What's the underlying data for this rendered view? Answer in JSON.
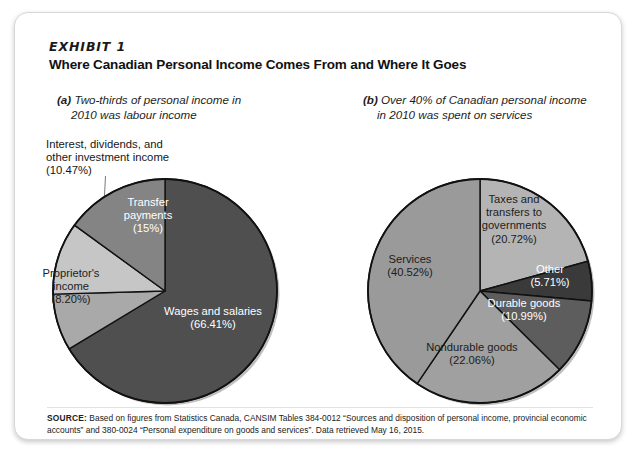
{
  "exhibit": {
    "label": "EXHIBIT 1",
    "title": "Where Canadian Personal Income Comes From and Where It Goes"
  },
  "panels": {
    "a": {
      "tag": "(a)",
      "caption_line1": "Two-thirds of personal income in",
      "caption_line2": "2010 was labour income",
      "callout": "Interest, dividends, and\nother investment income\n(10.47%)"
    },
    "b": {
      "tag": "(b)",
      "caption_line1": "Over 40% of Canadian personal income",
      "caption_line2": "in 2010 was spent on services"
    }
  },
  "source": {
    "label": "SOURCE:",
    "text": " Based on figures from Statistics Canada, CANSIM Tables 384-0012 “Sources and disposition of personal income, provincial economic accounts” and 380-0024 “Personal expenditure on goods and services”. Data retrieved May 16, 2015."
  },
  "colors": {
    "darkest": "#3a3a3a",
    "dark": "#4f4f4f",
    "mid_dark": "#6b6b6b",
    "mid": "#848484",
    "light": "#a9a9a9",
    "lightest": "#c6c6c6",
    "outline": "#111111",
    "text_on_dark": "#ffffff",
    "text_on_light": "#1c1c1c"
  },
  "chart_data": [
    {
      "type": "pie",
      "id": "sources-of-personal-income",
      "title": "Two-thirds of personal income in 2010 was labour income",
      "start_angle_deg": 0,
      "direction": "clockwise",
      "labels": [
        "Wages and salaries",
        "Proprietor's income",
        "Interest, dividends, and other investment income",
        "Transfer payments"
      ],
      "values": [
        66.41,
        8.2,
        10.47,
        15.0
      ],
      "value_labels": [
        "(66.41%)",
        "(8.20%)",
        "(10.47%)",
        "(15%)"
      ],
      "display_labels": [
        "Wages and salaries\n(66.41%)",
        "Proprietor's\nincome\n(8.20%)",
        "Interest, dividends, and\nother investment income\n(10.47%)",
        "Transfer\npayments\n(15%)"
      ],
      "slice_colors": [
        "#4f4f4f",
        "#a9a9a9",
        "#c6c6c6",
        "#848484"
      ],
      "label_text_colors": [
        "#ffffff",
        "#1c1c1c",
        "#1c1c1c",
        "#ffffff"
      ],
      "units": "percent"
    },
    {
      "type": "pie",
      "id": "disposition-of-personal-expenditure",
      "title": "Over 40% of Canadian personal income in 2010 was spent on services",
      "start_angle_deg": 0,
      "direction": "clockwise",
      "labels": [
        "Taxes and transfers to governments",
        "Other",
        "Durable goods",
        "Nondurable goods",
        "Services"
      ],
      "values": [
        20.72,
        5.71,
        10.99,
        22.06,
        40.52
      ],
      "value_labels": [
        "(20.72%)",
        "(5.71%)",
        "(10.99%)",
        "(22.06%)",
        "(40.52%)"
      ],
      "display_labels": [
        "Taxes and\ntransfers to\ngovernments\n(20.72%)",
        "Other\n(5.71%)",
        "Durable goods\n(10.99%)",
        "Nondurable goods\n(22.06%)",
        "Services\n(40.52%)"
      ],
      "slice_colors": [
        "#b4b4b4",
        "#3a3a3a",
        "#5d5d5d",
        "#a0a0a0",
        "#9a9a9a"
      ],
      "label_text_colors": [
        "#1c1c1c",
        "#ffffff",
        "#ffffff",
        "#1c1c1c",
        "#1c1c1c"
      ],
      "units": "percent"
    }
  ]
}
